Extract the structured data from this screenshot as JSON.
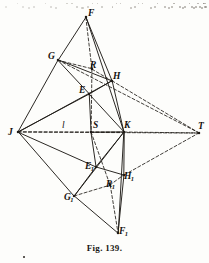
{
  "figure": {
    "caption": "Fig. 139.",
    "number": "139",
    "width": 209,
    "height": 263,
    "ink_color": "#201c18",
    "paper_color": "#fdfdfb"
  },
  "points": [
    {
      "id": "F",
      "label": "F",
      "sub": "",
      "x": 86,
      "y": 17,
      "lx": 88,
      "ly": 9,
      "marker": true
    },
    {
      "id": "G",
      "label": "G",
      "sub": "",
      "x": 58,
      "y": 60,
      "lx": 48,
      "ly": 52,
      "marker": true
    },
    {
      "id": "R",
      "label": "R",
      "sub": "",
      "x": 92,
      "y": 69,
      "lx": 90,
      "ly": 61,
      "marker": true
    },
    {
      "id": "H",
      "label": "H",
      "sub": "",
      "x": 112,
      "y": 81,
      "lx": 113,
      "ly": 72,
      "marker": true
    },
    {
      "id": "E",
      "label": "E",
      "sub": "",
      "x": 89,
      "y": 94,
      "lx": 79,
      "ly": 86,
      "marker": true
    },
    {
      "id": "J",
      "label": "J",
      "sub": "",
      "x": 18,
      "y": 132,
      "lx": 8,
      "ly": 128,
      "marker": true
    },
    {
      "id": "S",
      "label": "S",
      "sub": "",
      "x": 91,
      "y": 132,
      "lx": 93,
      "ly": 121,
      "marker": true
    },
    {
      "id": "K",
      "label": "K",
      "sub": "",
      "x": 124,
      "y": 132,
      "lx": 124,
      "ly": 121,
      "marker": true
    },
    {
      "id": "T",
      "label": "T",
      "sub": "",
      "x": 199,
      "y": 133,
      "lx": 198,
      "ly": 122,
      "marker": true
    },
    {
      "id": "E1",
      "label": "E",
      "sub": "1",
      "x": 96,
      "y": 167,
      "lx": 85,
      "ly": 162,
      "marker": true
    },
    {
      "id": "H1",
      "label": "H",
      "sub": "1",
      "x": 124,
      "y": 175,
      "lx": 124,
      "ly": 172,
      "marker": true
    },
    {
      "id": "R1",
      "label": "R",
      "sub": "1",
      "x": 110,
      "y": 185,
      "lx": 106,
      "ly": 180,
      "marker": true
    },
    {
      "id": "G1",
      "label": "G",
      "sub": "1",
      "x": 74,
      "y": 196,
      "lx": 64,
      "ly": 193,
      "marker": true
    },
    {
      "id": "F1",
      "label": "F",
      "sub": "1",
      "x": 118,
      "y": 233,
      "lx": 119,
      "ly": 227,
      "marker": true
    }
  ],
  "line_label": {
    "text": "l",
    "x": 62,
    "y": 121
  },
  "solid_edges": [
    [
      "F",
      "G"
    ],
    [
      "F",
      "H"
    ],
    [
      "F",
      "K"
    ],
    [
      "G",
      "E"
    ],
    [
      "G",
      "J"
    ],
    [
      "G",
      "H"
    ],
    [
      "E",
      "H"
    ],
    [
      "E",
      "J"
    ],
    [
      "E",
      "K"
    ],
    [
      "E",
      "S"
    ],
    [
      "H",
      "K"
    ],
    [
      "J",
      "E1"
    ],
    [
      "J",
      "G1"
    ],
    [
      "J",
      "H"
    ],
    [
      "K",
      "E1"
    ],
    [
      "K",
      "H1"
    ],
    [
      "K",
      "S"
    ],
    [
      "K",
      "G1"
    ],
    [
      "E1",
      "G1"
    ],
    [
      "E1",
      "H1"
    ],
    [
      "E1",
      "S"
    ],
    [
      "G1",
      "F1"
    ],
    [
      "H1",
      "F1"
    ],
    [
      "K",
      "F1"
    ]
  ],
  "dashed_edges": [
    [
      "J",
      "S"
    ],
    [
      "S",
      "K"
    ],
    [
      "K",
      "T"
    ],
    [
      "G",
      "R"
    ],
    [
      "R",
      "H"
    ],
    [
      "H",
      "T"
    ],
    [
      "F",
      "R"
    ],
    [
      "R",
      "S"
    ],
    [
      "S",
      "R1"
    ],
    [
      "R1",
      "F1"
    ],
    [
      "G1",
      "R1"
    ],
    [
      "R1",
      "H1"
    ],
    [
      "H1",
      "T"
    ],
    [
      "G",
      "T"
    ],
    [
      "J",
      "T"
    ]
  ],
  "legend": {
    "solid_meaning": "solid-construction-line",
    "dashed_meaning": "dashed-auxiliary-line"
  }
}
